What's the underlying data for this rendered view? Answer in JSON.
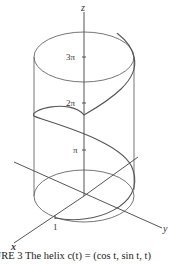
{
  "figure": {
    "caption": "GURE 3 The helix c(t) = (cos t, sin t, t)",
    "axes": {
      "x_label": "x",
      "y_label": "y",
      "z_label": "z"
    },
    "tick_labels": {
      "x_unit": "1",
      "z_pi": "π",
      "z_2pi": "2π",
      "z_3pi": "3π"
    },
    "colors": {
      "line": "#555555",
      "text": "#333333"
    }
  }
}
